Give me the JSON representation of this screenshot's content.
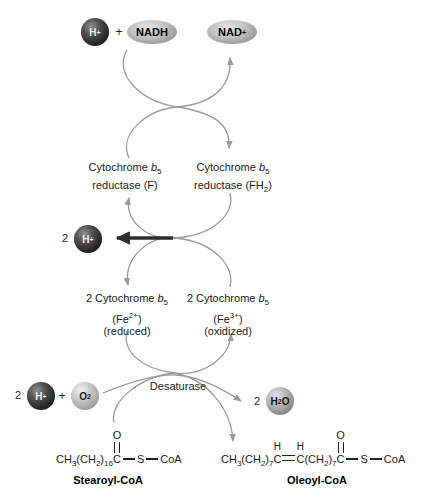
{
  "colors": {
    "curve": "#9a9a9a",
    "dark_arrow": "#2e2e2e",
    "text": "#1a1a1a"
  },
  "metabolites": {
    "h1": {
      "t": "H",
      "sup": "+"
    },
    "plus_top": "+",
    "nadh": "NADH",
    "nad": {
      "t": "NAD",
      "sup": "+"
    },
    "h2_count": "2",
    "h2": {
      "t": "H",
      "sup": "+"
    },
    "h3_count": "2",
    "h3": {
      "t": "H",
      "sup": "+"
    },
    "plus_bottom": "+",
    "o2": {
      "t": "O",
      "sub": "2"
    },
    "h2o_count": "2",
    "h2o": {
      "t1": "H",
      "sub": "2",
      "t2": "O"
    }
  },
  "enzymes": {
    "cyt_f": {
      "l1a": "Cytochrome ",
      "l1b": "b",
      "l1c": "5",
      "l2": "reductase (F)"
    },
    "cyt_fh2": {
      "l1a": "Cytochrome ",
      "l1b": "b",
      "l1c": "5",
      "l2a": "reductase (FH",
      "l2b": "2",
      "l2c": ")"
    },
    "b5_red": {
      "l1a": "2 Cytochrome ",
      "l1b": "b",
      "l1c": "5",
      "l2a": "(Fe",
      "l2b": "2+",
      "l2c": ")",
      "l3": "(reduced)"
    },
    "b5_ox": {
      "l1a": "2 Cytochrome ",
      "l1b": "b",
      "l1c": "5",
      "l2a": "(Fe",
      "l2b": "3+",
      "l2c": ")",
      "l3": "(oxidized)"
    },
    "desaturase": "Desaturase"
  },
  "stearoyl": {
    "f1": "CH",
    "f2": "3",
    "f3": "(CH",
    "f4": "2",
    "f5": ")",
    "f6": "16",
    "c": "C",
    "o": "O",
    "s": "S",
    "coa": "CoA",
    "label": "Stearoyl-CoA"
  },
  "oleoyl": {
    "f1": "CH",
    "f2": "3",
    "f3": "(CH",
    "f4": "2",
    "f5": ")",
    "f6": "7",
    "c1": "C",
    "h1": "H",
    "c2": "C",
    "h2": "H",
    "f7": "(CH",
    "f8": "2",
    "f9": ")",
    "f10": "7",
    "c3": "C",
    "o": "O",
    "s": "S",
    "coa": "CoA",
    "label": "Oleoyl-CoA"
  }
}
